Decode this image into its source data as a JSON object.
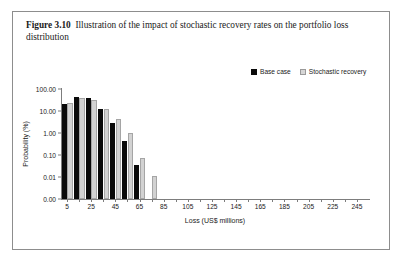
{
  "page": {
    "clipped_text_above": "· · · ·"
  },
  "figure": {
    "number_label": "Figure 3.10",
    "caption": "Illustration of the impact of stochastic recovery rates on the portfolio loss distribution"
  },
  "colors": {
    "base_case": "#0a0a0a",
    "stochastic_recovery": "#d2d2d2",
    "axis": "#7d7d7d",
    "border": "#8d8d8d",
    "text": "#1a1a1a",
    "background": "#ffffff"
  },
  "chart_data": {
    "type": "bar",
    "title": "",
    "xlabel": "Loss (US$ millions)",
    "ylabel": "Probability (%)",
    "yscale": "log",
    "ytick_labels": [
      "100.00",
      "10.00",
      "1.00",
      "0.10",
      "0.01",
      "0.00"
    ],
    "ytick_values": [
      100,
      10,
      1,
      0.1,
      0.01,
      0.001
    ],
    "ylim": [
      0.001,
      100
    ],
    "xlim": [
      0,
      255
    ],
    "xtick_labels": [
      "5",
      "25",
      "45",
      "65",
      "85",
      "105",
      "125",
      "145",
      "165",
      "185",
      "205",
      "225",
      "245"
    ],
    "xtick_values": [
      5,
      25,
      45,
      65,
      85,
      105,
      125,
      145,
      165,
      185,
      205,
      225,
      245
    ],
    "xminor_step": 10,
    "grid": false,
    "legend_position": "top-right",
    "categories": [
      5,
      15,
      25,
      35,
      45,
      55,
      65,
      75
    ],
    "series": [
      {
        "name": "Base case",
        "color": "#0a0a0a",
        "values": [
          20,
          42,
          38,
          12,
          3.0,
          0.45,
          0.035,
          null
        ]
      },
      {
        "name": "Stochastic recovery",
        "color": "#d2d2d2",
        "values": [
          24,
          38,
          33,
          13,
          4.5,
          1.0,
          0.075,
          0.011
        ]
      }
    ]
  }
}
